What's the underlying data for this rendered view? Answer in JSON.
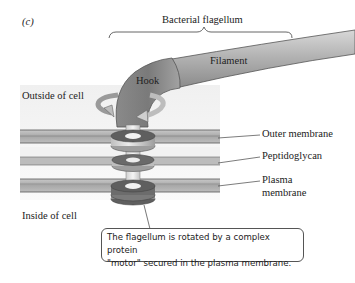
{
  "figure": {
    "panel_label": "(c)",
    "title": "Bacterial flagellum",
    "parts": {
      "hook": "Hook",
      "filament": "Filament"
    },
    "regions": {
      "outside": "Outside of cell",
      "inside": "Inside of cell"
    },
    "layers": [
      {
        "label": "Outer membrane"
      },
      {
        "label": "Peptidoglycan"
      },
      {
        "label_line1": "Plasma",
        "label_line2": "membrane"
      }
    ],
    "callout": {
      "line1": "The flagellum is rotated by a complex protein",
      "line2": "\"motor\" secured in the plasma membrane."
    },
    "colors": {
      "flagellum": "#9a9a9a",
      "membrane_dark": "#9c9c9c",
      "background_panel": "#efefef",
      "ring_dark": "#6e6e6e",
      "ring_light": "#cfcfcf"
    }
  }
}
